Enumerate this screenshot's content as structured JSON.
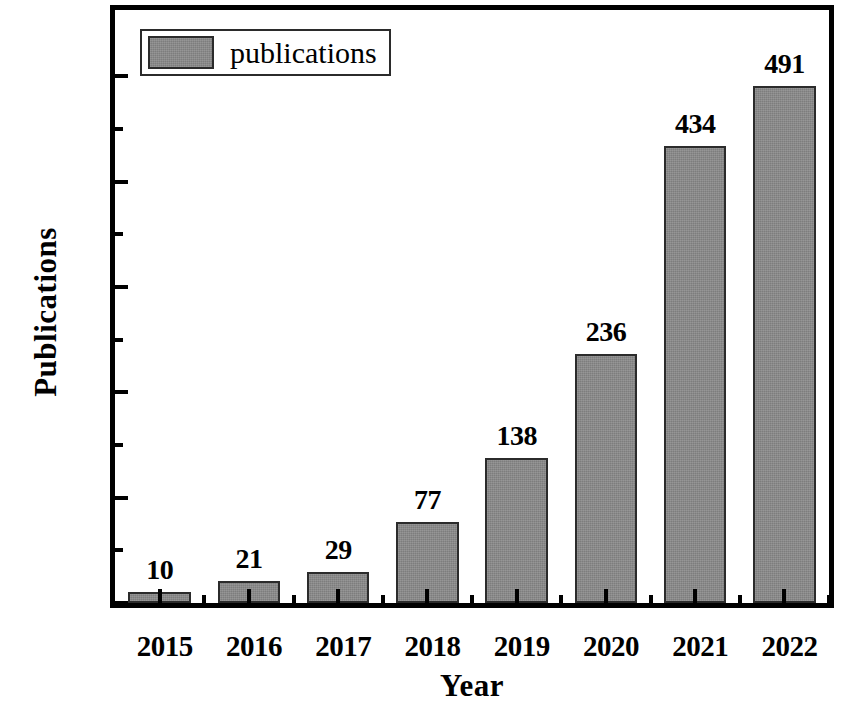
{
  "chart_data": {
    "type": "bar",
    "title": "",
    "subtitle": "",
    "xlabel": "Year",
    "ylabel": "Publications",
    "categories": [
      "2015",
      "2016",
      "2017",
      "2018",
      "2019",
      "2020",
      "2021",
      "2022"
    ],
    "values": [
      10,
      21,
      29,
      77,
      138,
      236,
      434,
      491
    ],
    "series": [
      {
        "name": "publications",
        "values": [
          10,
          21,
          29,
          77,
          138,
          236,
          434,
          491
        ]
      }
    ],
    "data_labels": [
      "10",
      "21",
      "29",
      "77",
      "138",
      "236",
      "434",
      "491"
    ],
    "ylim": [
      0,
      563
    ],
    "y_major_ticks": [
      0,
      100,
      200,
      300,
      400,
      500
    ],
    "y_major_tick_labels": [
      "0",
      "100",
      "200",
      "300",
      "400",
      "500"
    ],
    "y_minor_ticks": [
      50,
      150,
      250,
      350,
      450
    ],
    "grid": false,
    "legend": {
      "position": "top-left",
      "entries": [
        {
          "label": "publications",
          "color": "#8a8a8a"
        }
      ]
    },
    "bar_color": "#8a8a8a",
    "bar_edge_color": "#2b2b2b",
    "axis_color": "#000000",
    "background_color": "#ffffff"
  }
}
